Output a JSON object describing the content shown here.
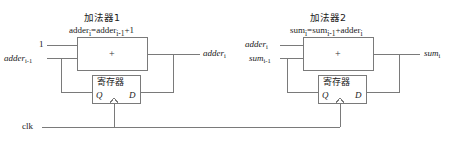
{
  "diagram": {
    "type": "circuit-block-diagram",
    "background": "#ffffff",
    "line_color": "#7a7a7a",
    "text_color": "#1a1a1a"
  },
  "adder1": {
    "title": "加法器1",
    "formula_lhs": "adder",
    "formula_lhs_sub": "i",
    "formula_eq": "=adder",
    "formula_rhs_sub": "i-1",
    "formula_tail": "+1",
    "formula_full": "adderi=adderi-1+1",
    "operator": "+",
    "input_top": "1",
    "input_bottom": "adder",
    "input_bottom_sub": "i-1",
    "output": "adder",
    "output_sub": "i",
    "register": {
      "name": "寄存器",
      "q_label": "Q",
      "d_label": "D"
    }
  },
  "adder2": {
    "title": "加法器2",
    "formula_lhs": "sum",
    "formula_lhs_sub": "i",
    "formula_eq": "=sum",
    "formula_rhs_sub": "i-1",
    "formula_tail": "+adder",
    "formula_tail_sub": "i",
    "formula_full": "sumi=sumi-1+adderi",
    "operator": "+",
    "input_top": "adder",
    "input_top_sub": "i",
    "input_bottom": "sum",
    "input_bottom_sub": "i-1",
    "output": "sum",
    "output_sub": "i",
    "register": {
      "name": "寄存器",
      "q_label": "Q",
      "d_label": "D"
    }
  },
  "clock": {
    "label": "clk"
  }
}
